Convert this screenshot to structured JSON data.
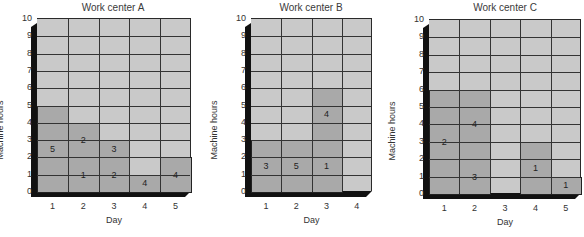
{
  "chart_data": [
    {
      "type": "bar",
      "title": "Work center A",
      "xlabel": "Day",
      "ylabel": "Machine hours",
      "ylim": [
        0,
        10
      ],
      "grid": true,
      "y_ticks": [
        "0",
        "1",
        "2",
        "3",
        "4",
        "5",
        "6",
        "7",
        "8",
        "9",
        "10"
      ],
      "categories": [
        "1",
        "2",
        "3",
        "4",
        "5"
      ],
      "stacked_jobs": [
        {
          "day": "1",
          "job": "5",
          "start": 0,
          "hours": 5
        },
        {
          "day": "2",
          "job": "1",
          "start": 0,
          "hours": 2
        },
        {
          "day": "2",
          "job": "2",
          "start": 2,
          "hours": 2
        },
        {
          "day": "3",
          "job": "2",
          "start": 0,
          "hours": 2
        },
        {
          "day": "3",
          "job": "3",
          "start": 2,
          "hours": 1
        },
        {
          "day": "4",
          "job": "4",
          "start": 0,
          "hours": 1
        },
        {
          "day": "5",
          "job": "4",
          "start": 0,
          "hours": 2
        }
      ],
      "totals": [
        5,
        4,
        3,
        1,
        2
      ]
    },
    {
      "type": "bar",
      "title": "Work center B",
      "xlabel": "Day",
      "ylabel": "Machine hours",
      "ylim": [
        0,
        10
      ],
      "grid": true,
      "y_ticks": [
        "0",
        "1",
        "2",
        "3",
        "4",
        "5",
        "6",
        "7",
        "8",
        "9",
        "10"
      ],
      "categories": [
        "1",
        "2",
        "3",
        "4"
      ],
      "stacked_jobs": [
        {
          "day": "1",
          "job": "3",
          "start": 0,
          "hours": 3
        },
        {
          "day": "2",
          "job": "5",
          "start": 0,
          "hours": 3
        },
        {
          "day": "3",
          "job": "1",
          "start": 0,
          "hours": 3
        },
        {
          "day": "3",
          "job": "4",
          "start": 3,
          "hours": 3
        }
      ],
      "totals": [
        3,
        3,
        6,
        0
      ]
    },
    {
      "type": "bar",
      "title": "Work center C",
      "xlabel": "Day",
      "ylabel": "Machine hours",
      "ylim": [
        0,
        10
      ],
      "grid": true,
      "y_ticks": [
        "0",
        "1",
        "2",
        "3",
        "4",
        "5",
        "6",
        "7",
        "8",
        "9",
        "10"
      ],
      "categories": [
        "1",
        "2",
        "3",
        "4",
        "5"
      ],
      "stacked_jobs": [
        {
          "day": "1",
          "job": "2",
          "start": 0,
          "hours": 6
        },
        {
          "day": "2",
          "job": "3",
          "start": 0,
          "hours": 2
        },
        {
          "day": "2",
          "job": "4",
          "start": 2,
          "hours": 4
        },
        {
          "day": "4",
          "job": "1",
          "start": 0,
          "hours": 3
        },
        {
          "day": "5",
          "job": "1",
          "start": 0,
          "hours": 1
        }
      ],
      "totals": [
        6,
        6,
        0,
        3,
        1
      ]
    }
  ],
  "colors": {
    "empty_cell": "#c9c9c9",
    "loaded_cell": "#a9a9a9",
    "frame": "#111111",
    "grid_line": "#333333"
  }
}
